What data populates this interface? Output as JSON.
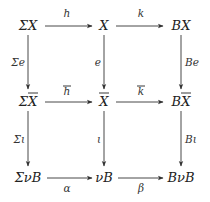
{
  "diagram": {
    "type": "commutative-diagram",
    "objects": {
      "r0c0": "ΣX",
      "r0c1": "X",
      "r0c2": "BX",
      "r1c0": "ΣX",
      "r1c1": "X",
      "r1c2": "BX",
      "r2c0": "ΣνB",
      "r2c1": "νB",
      "r2c2": "BνB"
    },
    "overlined": [
      "r1c0",
      "r1c1",
      "r1c2"
    ],
    "morphisms": {
      "h": "h",
      "k": "k",
      "hbar": "h",
      "kbar": "k",
      "alpha": "α",
      "beta": "β",
      "Sigma_e": "Σe",
      "e": "e",
      "Be": "Be",
      "Sigma_iota": "Σι",
      "iota": "ι",
      "B_iota": "Bι"
    },
    "overlined_morphisms": [
      "hbar",
      "kbar"
    ],
    "edges": [
      {
        "from": "r0c0",
        "to": "r0c1",
        "label": "h"
      },
      {
        "from": "r0c1",
        "to": "r0c2",
        "label": "k"
      },
      {
        "from": "r1c0",
        "to": "r1c1",
        "label": "hbar"
      },
      {
        "from": "r1c1",
        "to": "r1c2",
        "label": "kbar"
      },
      {
        "from": "r2c0",
        "to": "r2c1",
        "label": "alpha"
      },
      {
        "from": "r2c1",
        "to": "r2c2",
        "label": "beta"
      },
      {
        "from": "r0c0",
        "to": "r1c0",
        "label": "Sigma_e"
      },
      {
        "from": "r0c1",
        "to": "r1c1",
        "label": "e"
      },
      {
        "from": "r0c2",
        "to": "r1c2",
        "label": "Be"
      },
      {
        "from": "r1c0",
        "to": "r2c0",
        "label": "Sigma_iota"
      },
      {
        "from": "r1c1",
        "to": "r2c1",
        "label": "iota"
      },
      {
        "from": "r1c2",
        "to": "r2c2",
        "label": "B_iota"
      }
    ]
  }
}
